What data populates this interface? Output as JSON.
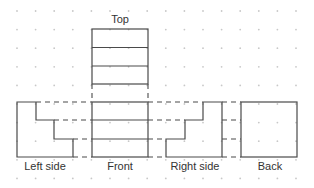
{
  "diagram": {
    "views": {
      "top": "Top",
      "left_side": "Left side",
      "front": "Front",
      "right_side": "Right side",
      "back": "Back"
    },
    "background": "dot-grid",
    "line_color": "#4a4a4a",
    "grid_dot_color": "#c8c8c8"
  }
}
